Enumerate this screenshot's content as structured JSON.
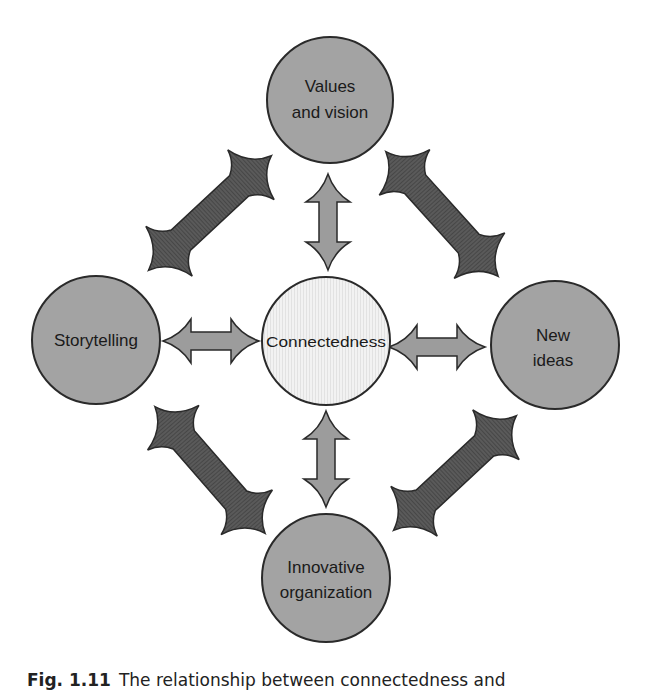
{
  "diagram": {
    "center": {
      "label": "Connectedness",
      "fill": "#efefef"
    },
    "nodes": [
      {
        "id": "top",
        "lines": [
          "Values",
          "and vision"
        ]
      },
      {
        "id": "left",
        "lines": [
          "Storytelling"
        ]
      },
      {
        "id": "right",
        "lines": [
          "New",
          "ideas"
        ]
      },
      {
        "id": "bottom",
        "lines": [
          "Innovative",
          "organization"
        ]
      }
    ],
    "colors": {
      "node_fill": "#a3a3a3",
      "center_fill": "#efefef",
      "small_arrow_fill": "#9c9c9c",
      "diagonal_arrow_fill": "#565656",
      "stroke": "#2a2a2a"
    },
    "connections": [
      {
        "from": "center",
        "to": "top",
        "style": "double-arrow"
      },
      {
        "from": "center",
        "to": "left",
        "style": "double-arrow"
      },
      {
        "from": "center",
        "to": "right",
        "style": "double-arrow"
      },
      {
        "from": "center",
        "to": "bottom",
        "style": "double-arrow"
      },
      {
        "from": "left",
        "to": "top",
        "style": "bold-double-arrow"
      },
      {
        "from": "top",
        "to": "right",
        "style": "bold-double-arrow"
      },
      {
        "from": "left",
        "to": "bottom",
        "style": "bold-double-arrow"
      },
      {
        "from": "right",
        "to": "bottom",
        "style": "bold-double-arrow"
      }
    ]
  },
  "caption": {
    "label": "Fig. 1.11",
    "text": "The relationship between connectedness and"
  }
}
